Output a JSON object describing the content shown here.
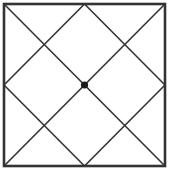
{
  "diagram": {
    "type": "geometric-figure",
    "stroke_color": "#333333",
    "square": {
      "x1": 4,
      "y1": 4,
      "x2": 165,
      "y2": 166,
      "stroke_width": 2.6
    },
    "lines": [
      {
        "name": "diagonal-main",
        "x1": 4,
        "y1": 4,
        "x2": 165,
        "y2": 166
      },
      {
        "name": "diagonal-anti",
        "x1": 165,
        "y1": 4,
        "x2": 4,
        "y2": 166
      },
      {
        "name": "diamond-top-left",
        "x1": 84.5,
        "y1": 4,
        "x2": 4,
        "y2": 85
      },
      {
        "name": "diamond-left-bottom",
        "x1": 4,
        "y1": 85,
        "x2": 84.5,
        "y2": 166
      },
      {
        "name": "diamond-bottom-right",
        "x1": 84.5,
        "y1": 166,
        "x2": 165,
        "y2": 85
      },
      {
        "name": "diamond-right-top",
        "x1": 165,
        "y1": 85,
        "x2": 84.5,
        "y2": 4
      }
    ],
    "line_width": 1.6,
    "center_point": {
      "cx": 84.5,
      "cy": 85,
      "r": 3.6,
      "fill": "#1a1a1a"
    }
  }
}
